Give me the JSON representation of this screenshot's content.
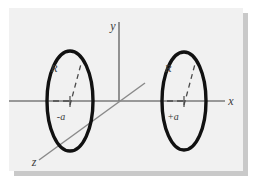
{
  "figure": {
    "caption_title": "Helmholtz coil pair on the x-axis",
    "background_color": "#f1f1f1",
    "page_color": "#ffffff",
    "shadow_color": "#c9c9c9",
    "axis_color": "#7a7a7a",
    "coil_color": "#111111",
    "label_color": "#3a3a3a"
  },
  "axes": [
    {
      "name": "x-axis",
      "label": "x",
      "label_x": 222,
      "label_y": 97
    },
    {
      "name": "y-axis",
      "label": "y",
      "label_x": 104,
      "label_y": 22
    },
    {
      "name": "z-axis",
      "label": "z",
      "label_x": 25,
      "label_y": 158
    }
  ],
  "coils": [
    {
      "name": "left-coil",
      "radius_label": "R",
      "position_label": "-a",
      "center_x": 61,
      "center_y": 93,
      "rx": 23,
      "ry": 50,
      "radius_label_x": 45,
      "radius_label_y": 64,
      "position_label_x": 52,
      "position_label_y": 112
    },
    {
      "name": "right-coil",
      "radius_label": "R",
      "position_label": "+a",
      "center_x": 175,
      "center_y": 93,
      "rx": 22,
      "ry": 49,
      "radius_label_x": 159,
      "radius_label_y": 64,
      "position_label_x": 164,
      "position_label_y": 112
    }
  ]
}
